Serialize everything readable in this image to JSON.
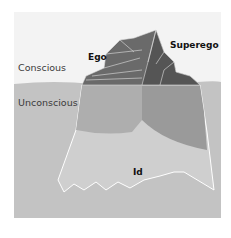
{
  "diagram": {
    "type": "iceberg-model",
    "labels": {
      "conscious": "Conscious",
      "unconscious": "Unconscious",
      "ego": "Ego",
      "superego": "Superego",
      "id": "Id"
    },
    "colors": {
      "sky": "#f3f3f3",
      "water": "#c3c3c3",
      "ice_top_left": "#6a6a6a",
      "ice_top_right": "#555555",
      "ego_underwater": "#aeaeae",
      "superego_underwater": "#9a9a9a",
      "id_region": "#cfcfcf",
      "outline": "#ffffff"
    }
  }
}
